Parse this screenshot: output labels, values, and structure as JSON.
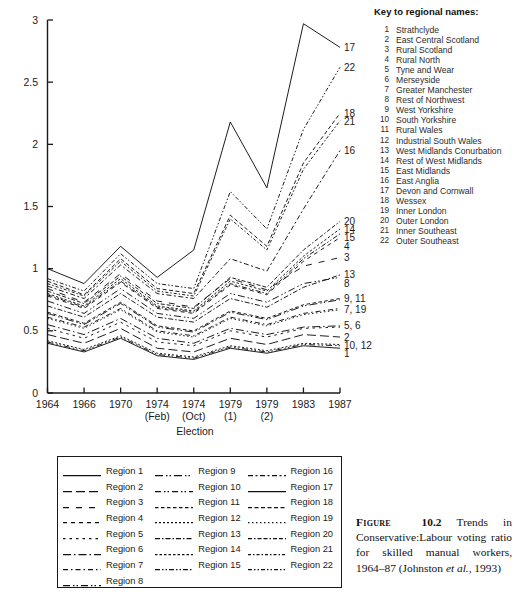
{
  "chart_data": {
    "type": "line",
    "title": "",
    "xlabel": "Election",
    "ylabel": "",
    "ylim": [
      0,
      3
    ],
    "yticks": [
      "0",
      "0.5",
      "1",
      "1.5",
      "2",
      "2.5",
      "3"
    ],
    "grid": false,
    "legend_position": "below-plot",
    "categories": [
      "1964",
      "1966",
      "1970",
      "1974 (Feb)",
      "1974 (Oct)",
      "1979 (1)",
      "1979 (2)",
      "1983",
      "1987"
    ],
    "xtick_labels": [
      {
        "line1": "1964",
        "line2": ""
      },
      {
        "line1": "1966",
        "line2": ""
      },
      {
        "line1": "1970",
        "line2": ""
      },
      {
        "line1": "1974",
        "line2": "(Feb)"
      },
      {
        "line1": "1974",
        "line2": "(Oct)"
      },
      {
        "line1": "1979",
        "line2": "(1)"
      },
      {
        "line1": "1979",
        "line2": "(2)"
      },
      {
        "line1": "1983",
        "line2": ""
      },
      {
        "line1": "1987",
        "line2": ""
      }
    ],
    "series": [
      {
        "name": "Region 1",
        "values": [
          0.4,
          0.33,
          0.44,
          0.3,
          0.27,
          0.36,
          0.32,
          0.38,
          0.36
        ]
      },
      {
        "name": "Region 2",
        "values": [
          0.47,
          0.4,
          0.52,
          0.36,
          0.33,
          0.44,
          0.39,
          0.47,
          0.45
        ]
      },
      {
        "name": "Region 3",
        "values": [
          0.84,
          0.73,
          0.96,
          0.74,
          0.69,
          0.92,
          0.83,
          1.02,
          1.09
        ]
      },
      {
        "name": "Region 4",
        "values": [
          0.78,
          0.68,
          0.89,
          0.68,
          0.64,
          0.87,
          0.79,
          1.06,
          1.25
        ]
      },
      {
        "name": "Region 5",
        "values": [
          0.52,
          0.44,
          0.57,
          0.41,
          0.38,
          0.5,
          0.45,
          0.52,
          0.53
        ]
      },
      {
        "name": "Region 6",
        "values": [
          0.55,
          0.47,
          0.6,
          0.44,
          0.4,
          0.52,
          0.47,
          0.53,
          0.54
        ]
      },
      {
        "name": "Region 7",
        "values": [
          0.61,
          0.53,
          0.68,
          0.5,
          0.46,
          0.61,
          0.55,
          0.64,
          0.68
        ]
      },
      {
        "name": "Region 8",
        "values": [
          0.74,
          0.64,
          0.84,
          0.64,
          0.6,
          0.8,
          0.73,
          0.88,
          0.93
        ]
      },
      {
        "name": "Region 9",
        "values": [
          0.64,
          0.55,
          0.72,
          0.53,
          0.49,
          0.65,
          0.59,
          0.7,
          0.75
        ]
      },
      {
        "name": "Region 10",
        "values": [
          0.41,
          0.34,
          0.45,
          0.31,
          0.28,
          0.37,
          0.33,
          0.39,
          0.38
        ]
      },
      {
        "name": "Region 11",
        "values": [
          0.65,
          0.56,
          0.73,
          0.54,
          0.5,
          0.66,
          0.6,
          0.71,
          0.76
        ]
      },
      {
        "name": "Region 12",
        "values": [
          0.42,
          0.35,
          0.46,
          0.32,
          0.29,
          0.38,
          0.34,
          0.4,
          0.39
        ]
      },
      {
        "name": "Region 13",
        "values": [
          0.7,
          0.61,
          0.8,
          0.61,
          0.57,
          0.76,
          0.69,
          0.85,
          0.95
        ]
      },
      {
        "name": "Region 14",
        "values": [
          0.8,
          0.7,
          0.92,
          0.7,
          0.66,
          0.9,
          0.82,
          1.1,
          1.32
        ]
      },
      {
        "name": "Region 15",
        "values": [
          0.79,
          0.69,
          0.9,
          0.69,
          0.65,
          0.88,
          0.8,
          1.08,
          1.28
        ]
      },
      {
        "name": "Region 16",
        "values": [
          0.86,
          0.76,
          1.03,
          0.8,
          0.76,
          1.08,
          0.98,
          1.48,
          1.95
        ]
      },
      {
        "name": "Region 17",
        "values": [
          1.0,
          0.88,
          1.18,
          0.93,
          1.15,
          2.18,
          1.65,
          2.97,
          2.78
        ]
      },
      {
        "name": "Region 18",
        "values": [
          0.9,
          0.79,
          1.08,
          0.84,
          0.8,
          1.43,
          1.18,
          1.85,
          2.25
        ]
      },
      {
        "name": "Region 19",
        "values": [
          0.6,
          0.52,
          0.67,
          0.49,
          0.45,
          0.6,
          0.54,
          0.63,
          0.67
        ]
      },
      {
        "name": "Region 20",
        "values": [
          0.82,
          0.72,
          0.94,
          0.72,
          0.68,
          0.93,
          0.85,
          1.15,
          1.38
        ]
      },
      {
        "name": "Region 21",
        "values": [
          0.88,
          0.78,
          1.06,
          0.82,
          0.78,
          1.4,
          1.15,
          1.8,
          2.19
        ]
      },
      {
        "name": "Region 22",
        "values": [
          0.92,
          0.82,
          1.12,
          0.88,
          0.84,
          1.62,
          1.32,
          2.12,
          2.62
        ]
      }
    ],
    "end_labels": [
      {
        "text": "17",
        "value": 2.78
      },
      {
        "text": "22",
        "value": 2.62
      },
      {
        "text": "18",
        "value": 2.25
      },
      {
        "text": "21",
        "value": 2.19
      },
      {
        "text": "16",
        "value": 1.95
      },
      {
        "text": "20",
        "value": 1.38
      },
      {
        "text": "14",
        "value": 1.32
      },
      {
        "text": "15",
        "value": 1.28
      },
      {
        "text": "4",
        "value": 1.25
      },
      {
        "text": "3",
        "value": 1.09
      },
      {
        "text": "13",
        "value": 0.95
      },
      {
        "text": "8",
        "value": 0.93
      },
      {
        "text": "9, 11",
        "value": 0.76
      },
      {
        "text": "7, 19",
        "value": 0.675
      },
      {
        "text": "5, 6",
        "value": 0.54
      },
      {
        "text": "2",
        "value": 0.45
      },
      {
        "text": "10, 12",
        "value": 0.385
      },
      {
        "text": "1",
        "value": 0.36
      }
    ]
  },
  "key_panel": {
    "title": "Key to regional names:",
    "items": [
      {
        "num": "1",
        "name": "Strathclyde"
      },
      {
        "num": "2",
        "name": "East Central Scotland"
      },
      {
        "num": "3",
        "name": "Rural Scotland"
      },
      {
        "num": "4",
        "name": "Rural North"
      },
      {
        "num": "5",
        "name": "Tyne and Wear"
      },
      {
        "num": "6",
        "name": "Merseyside"
      },
      {
        "num": "7",
        "name": "Greater Manchester"
      },
      {
        "num": "8",
        "name": "Rest of Northwest"
      },
      {
        "num": "9",
        "name": "West Yorkshire"
      },
      {
        "num": "10",
        "name": "South Yorkshire"
      },
      {
        "num": "11",
        "name": "Rural Wales"
      },
      {
        "num": "12",
        "name": "Industrial South Wales"
      },
      {
        "num": "13",
        "name": "West Midlands Conurbation"
      },
      {
        "num": "14",
        "name": "Rest of West Midlands"
      },
      {
        "num": "15",
        "name": "East Midlands"
      },
      {
        "num": "16",
        "name": "East Anglia"
      },
      {
        "num": "17",
        "name": "Devon and Cornwall"
      },
      {
        "num": "18",
        "name": "Wessex"
      },
      {
        "num": "19",
        "name": "Inner London"
      },
      {
        "num": "20",
        "name": "Outer London"
      },
      {
        "num": "21",
        "name": "Inner Southeast"
      },
      {
        "num": "22",
        "name": "Outer Southeast"
      }
    ]
  },
  "legend": {
    "columns": [
      [
        {
          "label": "Region 1",
          "dash": "none"
        },
        {
          "label": "Region 2",
          "dash": "9,4"
        },
        {
          "label": "Region 3",
          "dash": "6,7"
        },
        {
          "label": "Region 4",
          "dash": "4,4"
        },
        {
          "label": "Region 5",
          "dash": "2.5,4"
        },
        {
          "label": "Region 6",
          "dash": "8,3,1.5,3"
        },
        {
          "label": "Region 7",
          "dash": "5,3,1.5,3"
        },
        {
          "label": "Region 8",
          "dash": "7,3,1.5,2,1.5,3"
        }
      ],
      [
        {
          "label": "Region 9",
          "dash": "8,3,1.5,2,1.5,3"
        },
        {
          "label": "Region 10",
          "dash": "6,3,1.5,2,1.5,3"
        },
        {
          "label": "Region 11",
          "dash": "3.5,2.5"
        },
        {
          "label": "Region 12",
          "dash": "2,2"
        },
        {
          "label": "Region 13",
          "dash": "5,2,1.5,2"
        },
        {
          "label": "Region 14",
          "dash": "2.5,2"
        },
        {
          "label": "Region 15",
          "dash": "5,2,1.5,2,1.5,2"
        }
      ],
      [
        {
          "label": "Region 16",
          "dash": "5,2.5,2,2.5"
        },
        {
          "label": "Region 17",
          "dash": "none"
        },
        {
          "label": "Region 18",
          "dash": "4,2.5"
        },
        {
          "label": "Region 19",
          "dash": "1.5,2.5"
        },
        {
          "label": "Region 20",
          "dash": "4,2,1.5,2,4,2"
        },
        {
          "label": "Region 21",
          "dash": "3,2,1.5,2"
        },
        {
          "label": "Region 22",
          "dash": "4,2,1.5,2,1.5,2"
        }
      ]
    ]
  },
  "caption": {
    "fig_word": "Figure",
    "fig_num": "10.2",
    "text": " Trends in Conservative:Labour voting ratio for skilled manual workers, 1964–87 (Johnston ",
    "italic": "et al.",
    "tail": ", 1993)"
  }
}
